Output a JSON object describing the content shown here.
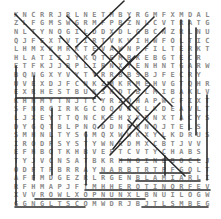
{
  "puzzle": {
    "type": "word-search",
    "rows": 23,
    "cols": 23,
    "grid": [
      "KNCRRJRLNETMBYRGMFXMDAL",
      "ZLFGMSWGRMFPBZNLCVTRATG",
      "NLTYNOGILDDXDLGBCNZRLNU",
      "QJFEXTVTIRTVKVIHWFOLTIC",
      "LHMXKMRKTEVAWNPFILTERKT",
      "HLATIIJYKQTEMBKEBGTECR",
      "ETFKJJBPLIRNXYENHNTGARW",
      "BQNGXYVYTYRRBBSBJFECRY",
      "UVEXDJFCNKZMKRMEHVGTQHR",
      "EXRHESTBUKSKDTBLMIBAKLV",
      "KHNMYTNJTCYRZDHAPWCFIXTE",
      "SFNRCIRKGCOQVRKLKDEAVLT",
      "LJXEYTTQNCKEHXXDNXTACYS",
      "DYGQTBLPNQDDNRNNOJTELS",
      "SMHNLTYSGMQXWWKXYLKDRUS",
      "IRODFSYSTYWNRDMXCBTJVV",
      "EFHBQTKHBVEFTCVTYCHABS",
      "TYJVCNSATBKRHNOINEBOCLJ",
      "ODFTFBRRAYNARBTRTPFGOLT",
      "AFFMDGEZRLRGENBLAMIARLIEDQ",
      "RFHMAPJFTMHHEROTINORFEVOL",
      "XVVROWLXOPNUNXLBNUILOGWPFNFKE",
      "GGNGLTSCOMWDRJBJTLSMBEGNOSBLC"
    ],
    "cell_positions": {
      "origin_x": 16,
      "origin_y": 15,
      "step_x": 8.7,
      "step_y": 8.6
    }
  },
  "lines": [
    {
      "x1": 15,
      "y1": 14,
      "x2": 101,
      "y2": 100
    },
    {
      "x1": 60,
      "y1": 36,
      "x2": 130,
      "y2": 110
    },
    {
      "x1": 67,
      "y1": 16,
      "x2": 140,
      "y2": 90
    },
    {
      "x1": 76,
      "y1": 47,
      "x2": 124,
      "y2": 1
    },
    {
      "x1": 154,
      "y1": 17,
      "x2": 95,
      "y2": 76
    },
    {
      "x1": 165,
      "y1": 28,
      "x2": 93,
      "y2": 99
    },
    {
      "x1": 112,
      "y1": 46,
      "x2": 172,
      "y2": 106
    },
    {
      "x1": 92,
      "y1": 55,
      "x2": 130,
      "y2": 17
    },
    {
      "x1": 108,
      "y1": 82,
      "x2": 165,
      "y2": 139
    },
    {
      "x1": 103,
      "y1": 90,
      "x2": 135,
      "y2": 56
    },
    {
      "x1": 128,
      "y1": 108,
      "x2": 150,
      "y2": 85
    },
    {
      "x1": 128,
      "y1": 120,
      "x2": 185,
      "y2": 176
    },
    {
      "x1": 137,
      "y1": 118,
      "x2": 113,
      "y2": 149
    },
    {
      "x1": 160,
      "y1": 103,
      "x2": 110,
      "y2": 155
    },
    {
      "x1": 98,
      "y1": 128,
      "x2": 136,
      "y2": 90
    },
    {
      "x1": 181,
      "y1": 20,
      "x2": 181,
      "y2": 120
    },
    {
      "x1": 189,
      "y1": 20,
      "x2": 189,
      "y2": 130
    },
    {
      "x1": 196,
      "y1": 28,
      "x2": 196,
      "y2": 135
    },
    {
      "x1": 207,
      "y1": 95,
      "x2": 207,
      "y2": 180
    },
    {
      "x1": 16,
      "y1": 66,
      "x2": 16,
      "y2": 205
    },
    {
      "x1": 34,
      "y1": 76,
      "x2": 34,
      "y2": 180
    },
    {
      "x1": 16,
      "y1": 98,
      "x2": 95,
      "y2": 98
    },
    {
      "x1": 52,
      "y1": 108,
      "x2": 52,
      "y2": 175
    },
    {
      "x1": 86,
      "y1": 132,
      "x2": 86,
      "y2": 185
    },
    {
      "x1": 165,
      "y1": 156,
      "x2": 165,
      "y2": 175
    },
    {
      "x1": 120,
      "y1": 160,
      "x2": 200,
      "y2": 160
    },
    {
      "x1": 100,
      "y1": 173,
      "x2": 190,
      "y2": 173
    },
    {
      "x1": 136,
      "y1": 181,
      "x2": 200,
      "y2": 181
    },
    {
      "x1": 85,
      "y1": 190,
      "x2": 210,
      "y2": 190
    },
    {
      "x1": 35,
      "y1": 199,
      "x2": 145,
      "y2": 199
    },
    {
      "x1": 15,
      "y1": 207,
      "x2": 85,
      "y2": 207
    },
    {
      "x1": 142,
      "y1": 207,
      "x2": 208,
      "y2": 207
    }
  ],
  "colors": {
    "letter": "#8a8a8a",
    "line": "#2a2a2a",
    "background": "#ffffff"
  }
}
